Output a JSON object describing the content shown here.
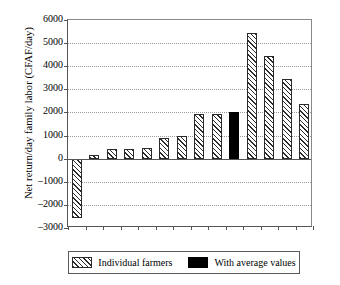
{
  "chart_data": {
    "type": "bar",
    "title": "",
    "xlabel": "",
    "ylabel": "Net return/day family labor (CFAF/day)",
    "ylim": [
      -3000,
      6000
    ],
    "ytick_step": 1000,
    "yticks": [
      "6000",
      "5000",
      "4000",
      "3000",
      "2000",
      "1000",
      "0",
      "-1000",
      "-2000",
      "-3000"
    ],
    "grid": "horizontal-dotted",
    "legend_position": "below-plot",
    "categories": [
      "1",
      "2",
      "3",
      "4",
      "5",
      "6",
      "7",
      "8",
      "9",
      "avg",
      "10",
      "11",
      "12",
      "13"
    ],
    "series": [
      {
        "name": "Individual farmers",
        "style": "hatched",
        "color": "#2b2b2b",
        "values": [
          -2550,
          170,
          430,
          430,
          470,
          880,
          1000,
          1920,
          1930,
          null,
          5450,
          4450,
          3430,
          2370
        ]
      },
      {
        "name": "With average values",
        "style": "solid",
        "color": "#000000",
        "values": [
          null,
          null,
          null,
          null,
          null,
          null,
          null,
          null,
          null,
          2030,
          null,
          null,
          null,
          null
        ]
      }
    ]
  },
  "legend": {
    "entries": [
      {
        "label": "Individual farmers",
        "swatch": "hatched-swatch"
      },
      {
        "label": "With average values",
        "swatch": "solid-black-swatch"
      }
    ]
  }
}
